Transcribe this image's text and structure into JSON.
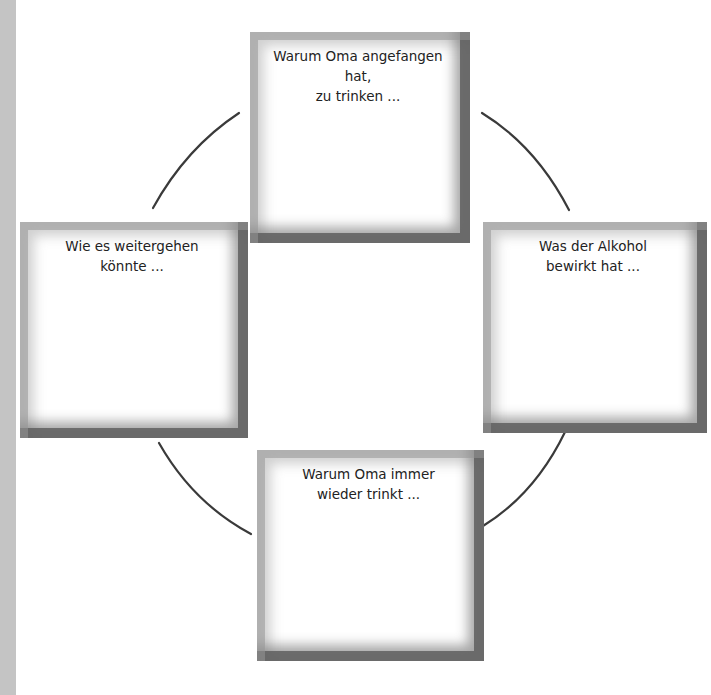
{
  "diagram": {
    "type": "cycle",
    "boxes": {
      "top": {
        "label": "Warum Oma angefangen hat,\nzu trinken ..."
      },
      "right": {
        "label": "Was der Alkohol\nbewirkt hat ..."
      },
      "bottom": {
        "label": "Warum Oma immer\nwieder trinkt ..."
      },
      "left": {
        "label": "Wie es weitergehen\nkönnte ..."
      }
    },
    "connectors": [
      {
        "from": "left",
        "to": "top"
      },
      {
        "from": "top",
        "to": "right"
      },
      {
        "from": "right",
        "to": "bottom"
      },
      {
        "from": "bottom",
        "to": "left"
      }
    ],
    "colors": {
      "line": "#3a3a3a",
      "text": "#222222",
      "side_band": "#c4c4c4",
      "frame_dark": "#5f5f5f",
      "frame_light": "#969696"
    }
  }
}
